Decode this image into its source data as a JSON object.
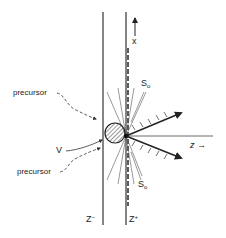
{
  "diagram": {
    "labels": {
      "x_axis": "x",
      "z_axis": "z",
      "z_arrow": "→",
      "precursor_top": "precursor",
      "precursor_bottom": "precursor",
      "v_label": "V",
      "s0_top_base": "S",
      "s0_top_sub": "o",
      "s0_bottom_base": "S",
      "s0_bottom_sub": "o",
      "z_minus_base": "Z",
      "z_minus_sup": "−",
      "z_plus_base": "Z",
      "z_plus_sup": "+"
    },
    "colors": {
      "line": "#333333",
      "thin_line": "#555555",
      "text": "#222222",
      "background": "#ffffff"
    }
  }
}
